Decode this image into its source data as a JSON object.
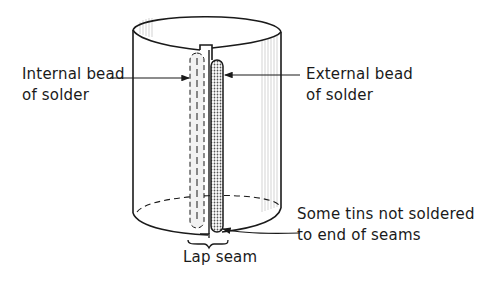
{
  "diagram": {
    "labels": {
      "internal_bead": {
        "line1": "Internal bead",
        "line2": "of solder"
      },
      "external_bead": {
        "line1": "External bead",
        "line2": "of solder"
      },
      "tins_not_soldered": {
        "line1": "Some tins not soldered",
        "line2": "to end of seams"
      },
      "lap_seam": "Lap seam"
    },
    "colors": {
      "ink": "#1a1a1a",
      "background": "#ffffff",
      "shading": "#9a9a9a"
    }
  }
}
